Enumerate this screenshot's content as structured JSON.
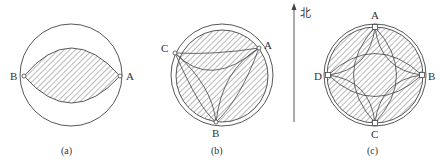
{
  "figures": [
    {
      "caption": "(a)",
      "points": {
        "A": "A",
        "B": "B"
      }
    },
    {
      "caption": "(b)",
      "points": {
        "A": "A",
        "B": "B",
        "C": "C"
      }
    },
    {
      "caption": "(c)",
      "points": {
        "A": "A",
        "B": "B",
        "C": "C",
        "D": "D"
      }
    }
  ],
  "north_arrow": {
    "label": "北"
  },
  "colors": {
    "stroke": "#444444",
    "hatch": "#555555",
    "background": "#ffffff"
  }
}
